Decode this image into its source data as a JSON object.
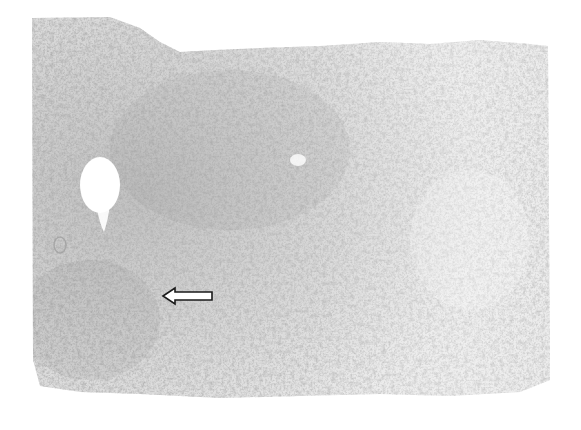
{
  "figure": {
    "type": "histology-micrograph",
    "colors": {
      "background": "#ffffff",
      "tissue_base": "#d9d9d9",
      "tissue_dense": "#a9a9a9",
      "nuclei": "#6e6e6e",
      "arrow_fill": "#ffffff",
      "arrow_stroke": "#1a1a1a"
    },
    "tissue_region": {
      "left": 32,
      "top": 15,
      "right": 548,
      "bottom": 398
    },
    "features": [
      {
        "name": "vacuole",
        "cx": 100,
        "cy": 185,
        "rx": 22,
        "ry": 30
      },
      {
        "name": "small-lumen",
        "cx": 60,
        "cy": 245,
        "rx": 6,
        "ry": 8
      }
    ],
    "annotations": [
      {
        "name": "arrow",
        "direction": "left",
        "tip_x": 163,
        "tip_y": 296,
        "tail_x": 212,
        "tail_y": 296
      }
    ]
  }
}
